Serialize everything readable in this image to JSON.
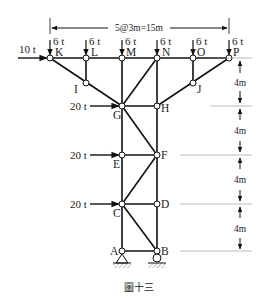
{
  "figure": {
    "caption": "圖十三",
    "span_dimension": "5@3m=15m",
    "panel_heights": [
      "4m",
      "4m",
      "4m",
      "4m"
    ]
  },
  "nodes": {
    "K": "K",
    "L": "L",
    "M": "M",
    "N": "N",
    "O": "O",
    "P": "P",
    "I": "I",
    "J": "J",
    "G": "G",
    "H": "H",
    "E": "E",
    "F": "F",
    "C": "C",
    "D": "D",
    "A": "A",
    "B": "B"
  },
  "loads": {
    "horizontal_top": "10 t",
    "vertical_K": "6 t",
    "vertical_L": "6 t",
    "vertical_M": "6 t",
    "vertical_N": "6 t",
    "vertical_O": "6 t",
    "vertical_P": "6 t",
    "horizontal_G": "20 t",
    "horizontal_E": "20 t",
    "horizontal_C": "20 t"
  },
  "colors": {
    "member": "#111111",
    "node_fill": "#ffffff",
    "ground_hatch": "#888888"
  }
}
